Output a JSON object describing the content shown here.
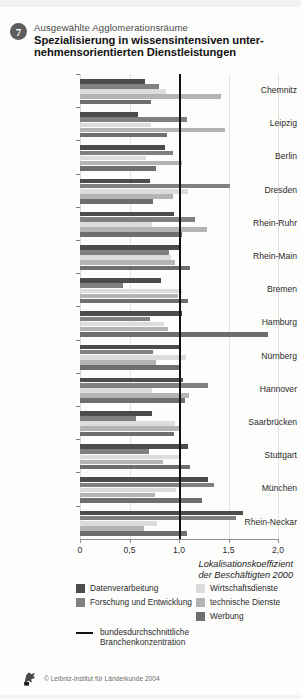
{
  "header": {
    "number": "7",
    "subtitle": "Ausgewählte Agglomerationsräume",
    "title_line1": "Spezialisierung in wissensintensiven unter-",
    "title_line2": "nehmensorientierten Dienstleistungen"
  },
  "axis": {
    "ticks": [
      "0",
      "0,5",
      "1,0",
      "1,5",
      "2,0"
    ],
    "tick_values": [
      0,
      0.5,
      1.0,
      1.5,
      2.0
    ],
    "title_line1": "Lokalisationskoeffizient",
    "title_line2": "der Beschäftigten 2000"
  },
  "legend": {
    "column1": [
      {
        "label": "Datenverarbeitung",
        "color": "#4c4c4c"
      },
      {
        "label": "Forschung und Entwicklung",
        "color": "#808080"
      }
    ],
    "column2": [
      {
        "label": "Wirtschaftsdienste",
        "color": "#dcdcdc"
      },
      {
        "label": "technische Dienste",
        "color": "#b4b4b4"
      },
      {
        "label": "Werbung",
        "color": "#6e6e6e"
      }
    ],
    "reference_line": {
      "label_line1": "bundesdurchschnittliche",
      "label_line2": "Branchenkonzentration",
      "color": "#111111",
      "value": 1.0
    }
  },
  "footer": {
    "copyright": "© Leibniz-Institut für Länderkunde 2004",
    "logo_name": "leibniz-institut-logo"
  },
  "chart_data": {
    "type": "bar",
    "orientation": "horizontal",
    "subtitle": "Ausgewählte Agglomerationsräume",
    "xlabel": "Lokalisationskoeffizient der Beschäftigten 2000",
    "ylabel": "",
    "xlim": [
      0,
      2.0
    ],
    "xticks": [
      0,
      0.5,
      1.0,
      1.5,
      2.0
    ],
    "grid": true,
    "reference_line_x": 1.0,
    "legend_position": "bottom",
    "categories": [
      "Chemnitz",
      "Leipzig",
      "Berlin",
      "Dresden",
      "Rhein-Ruhr",
      "Rhein-Main",
      "Bremen",
      "Hamburg",
      "Nürnberg",
      "Hannover",
      "Saarbrücken",
      "Stuttgart",
      "München",
      "Rhein-Neckar"
    ],
    "series": [
      {
        "name": "Datenverarbeitung",
        "color": "#4c4c4c",
        "values": [
          0.66,
          0.59,
          0.86,
          0.71,
          0.95,
          1.01,
          0.82,
          1.03,
          1.0,
          1.04,
          0.73,
          1.09,
          1.29,
          1.65
        ]
      },
      {
        "name": "Forschung und Entwicklung",
        "color": "#808080",
        "values": [
          0.8,
          1.08,
          0.94,
          1.52,
          1.16,
          0.9,
          0.43,
          0.71,
          0.74,
          1.29,
          0.57,
          0.7,
          1.35,
          1.58
        ]
      },
      {
        "name": "Wirtschaftsdienste",
        "color": "#dcdcdc",
        "values": [
          0.87,
          0.72,
          0.67,
          1.09,
          0.73,
          0.92,
          1.03,
          0.85,
          1.07,
          0.73,
          0.96,
          1.02,
          0.97,
          0.78
        ]
      },
      {
        "name": "technische Dienste",
        "color": "#b4b4b4",
        "values": [
          1.42,
          1.46,
          1.03,
          0.94,
          1.28,
          0.96,
          0.99,
          0.89,
          0.77,
          1.1,
          1.02,
          0.84,
          0.76,
          0.65
        ]
      },
      {
        "name": "Werbung",
        "color": "#6e6e6e",
        "values": [
          0.72,
          0.88,
          0.77,
          0.74,
          1.03,
          1.11,
          1.09,
          1.9,
          1.02,
          1.06,
          0.95,
          1.11,
          1.23,
          1.08
        ]
      }
    ]
  }
}
